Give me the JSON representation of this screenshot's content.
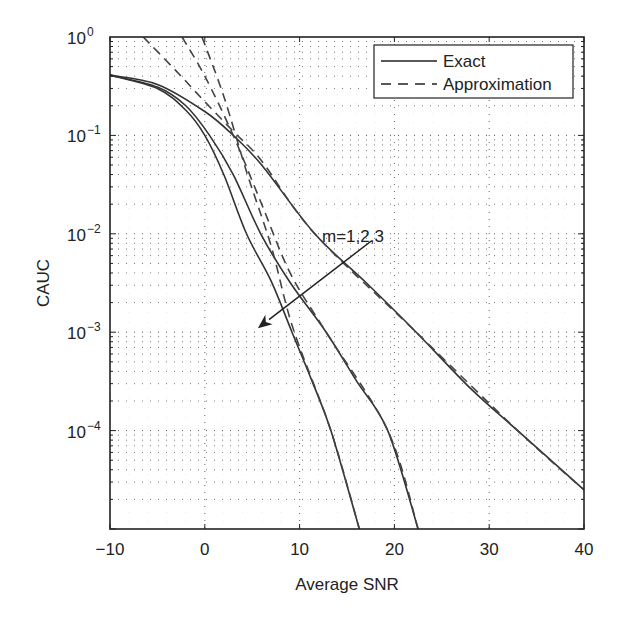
{
  "chart_data": {
    "type": "line",
    "title": "",
    "xlabel": "Average SNR",
    "ylabel": "CAUC",
    "xscale": "linear",
    "yscale": "log",
    "xlim": [
      -10,
      40
    ],
    "ylim": [
      1e-05,
      1
    ],
    "x_ticks": [
      "-10",
      "0",
      "10",
      "20",
      "30",
      "40"
    ],
    "x_tick_values": [
      -10,
      0,
      10,
      20,
      30,
      40
    ],
    "y_ticks": [
      {
        "base": "10",
        "exp": "0",
        "value": 1
      },
      {
        "base": "10",
        "exp": "-1",
        "value": 0.1
      },
      {
        "base": "10",
        "exp": "-2",
        "value": 0.01
      },
      {
        "base": "10",
        "exp": "-3",
        "value": 0.001
      },
      {
        "base": "10",
        "exp": "-4",
        "value": 0.0001
      }
    ],
    "grid": "dotted major and minor",
    "legend": {
      "position": "upper right",
      "entries": [
        {
          "label": "Exact",
          "style": "solid"
        },
        {
          "label": "Approximation",
          "style": "dashed"
        }
      ]
    },
    "annotation": {
      "text": "m=1,2,3",
      "arrow_from": [
        17.6,
        0.0085
      ],
      "arrow_to": [
        5.6,
        0.0011
      ]
    },
    "series": [
      {
        "name": "Exact m=1",
        "style": "solid",
        "x": [
          -10,
          -5,
          0,
          3,
          6,
          11.6,
          17,
          22.3,
          28,
          33,
          40
        ],
        "y": [
          0.41,
          0.33,
          0.175,
          0.1,
          0.05,
          0.01,
          0.0032,
          0.001,
          0.00027,
          0.0001,
          2.5e-05
        ]
      },
      {
        "name": "Exact m=2",
        "style": "solid",
        "x": [
          -10,
          -5,
          -2,
          0.5,
          3,
          5.9,
          9,
          12.8,
          16,
          19.3,
          22.5
        ],
        "y": [
          0.41,
          0.31,
          0.2,
          0.1,
          0.04,
          0.01,
          0.0032,
          0.001,
          0.00032,
          0.0001,
          1e-05
        ]
      },
      {
        "name": "Exact m=3",
        "style": "solid",
        "x": [
          -10,
          -5,
          -2,
          0,
          2,
          4.4,
          7,
          9.2,
          11.3,
          13.3,
          16.3
        ],
        "y": [
          0.41,
          0.3,
          0.18,
          0.1,
          0.04,
          0.01,
          0.0033,
          0.001,
          0.00032,
          0.0001,
          1e-05
        ]
      },
      {
        "name": "Approximation m=1",
        "style": "dashed",
        "x": [
          -6.5,
          -3,
          0,
          3,
          6,
          11.6,
          22.3,
          33,
          40
        ],
        "y": [
          1.0,
          0.45,
          0.22,
          0.11,
          0.055,
          0.01,
          0.001,
          0.0001,
          2.5e-05
        ]
      },
      {
        "name": "Approximation m=2",
        "style": "dashed",
        "x": [
          -2.4,
          0,
          3,
          6,
          9,
          12.8,
          19.3,
          22.5
        ],
        "y": [
          1.0,
          0.4,
          0.1,
          0.02,
          0.004,
          0.001,
          0.0001,
          1e-05
        ]
      },
      {
        "name": "Approximation m=3",
        "style": "dashed",
        "x": [
          -0.3,
          2,
          4.5,
          7,
          9.3,
          13.3,
          16.3
        ],
        "y": [
          1.0,
          0.25,
          0.04,
          0.0075,
          0.0011,
          0.0001,
          1e-05
        ]
      }
    ]
  }
}
